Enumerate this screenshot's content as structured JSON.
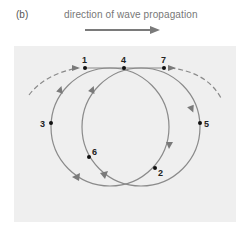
{
  "figure": {
    "panel_label": "(b)",
    "title": "direction of wave propagation",
    "colors": {
      "background": "#ffffff",
      "panel": "#efefef",
      "curve": "#8a8a8a",
      "arrow": "#7a7a7a",
      "point": "#111111",
      "text": "#222222"
    }
  },
  "points": [
    {
      "label": "1",
      "x": 85,
      "y": 68,
      "lx": 81,
      "ly": 63
    },
    {
      "label": "2",
      "x": 155,
      "y": 168,
      "lx": 158,
      "ly": 175
    },
    {
      "label": "3",
      "x": 51,
      "y": 123,
      "lx": 40,
      "ly": 127
    },
    {
      "label": "4",
      "x": 124,
      "y": 68,
      "lx": 120,
      "ly": 63
    },
    {
      "label": "5",
      "x": 200,
      "y": 123,
      "lx": 204,
      "ly": 127
    },
    {
      "label": "6",
      "x": 89,
      "y": 157,
      "lx": 92,
      "ly": 155
    },
    {
      "label": "7",
      "x": 164,
      "y": 68,
      "lx": 160,
      "ly": 63
    }
  ]
}
